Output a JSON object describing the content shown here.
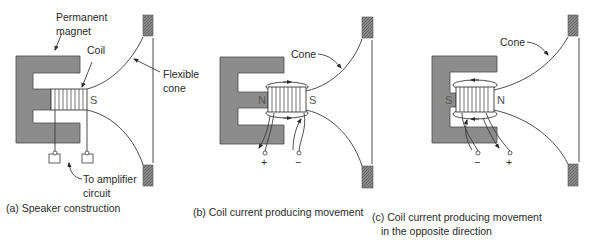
{
  "figure": {
    "colors": {
      "magnet": "#8c8c8c",
      "frame_block": "#6e6e6e",
      "line": "#3a3a3a",
      "text": "#2a2a2a"
    },
    "panels": [
      {
        "id": "a",
        "caption": "(a) Speaker construction",
        "labels": {
          "magnet_line1": "Permanent",
          "magnet_line2": "magnet",
          "coil": "Coil",
          "pole": "S",
          "cone_line1": "Flexible",
          "cone_line2": "cone",
          "amp_line1": "To amplifier",
          "amp_line2": "circuit"
        }
      },
      {
        "id": "b",
        "caption": "(b) Coil current producing movement",
        "labels": {
          "cone": "Cone",
          "pole_left": "N",
          "pole_right": "S",
          "terminal_plus": "+",
          "terminal_minus": "−"
        }
      },
      {
        "id": "c",
        "caption_line1": "(c) Coil current producing movement",
        "caption_line2": "in the opposite direction",
        "labels": {
          "cone": "Cone",
          "pole_left": "S",
          "pole_right": "N",
          "terminal_minus": "−",
          "terminal_plus": "+"
        }
      }
    ]
  }
}
